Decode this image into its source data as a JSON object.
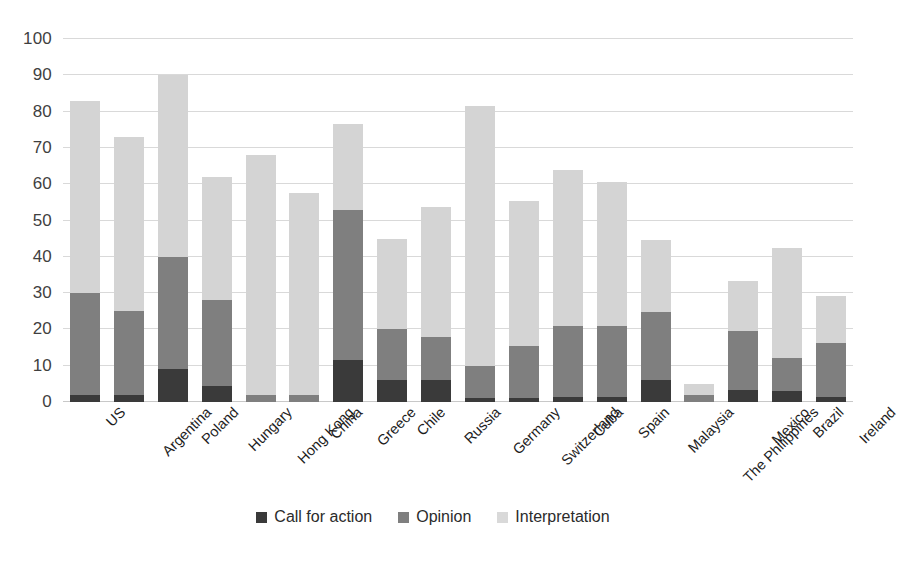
{
  "chart_data": {
    "type": "bar",
    "subtype": "stacked-bar",
    "title": "",
    "xlabel": "",
    "ylabel": "",
    "ylim": [
      0,
      100
    ],
    "yticks": [
      0,
      10,
      20,
      30,
      40,
      50,
      60,
      70,
      80,
      90,
      100
    ],
    "grid": true,
    "legend_position": "bottom",
    "categories": [
      "US",
      "Argentina",
      "Poland",
      "Hungary",
      "Hong Kong",
      "China",
      "Greece",
      "Chile",
      "Russia",
      "Germany",
      "Switzerland",
      "Cuba",
      "Spain",
      "Malaysia",
      "The Philippines",
      "Mexico",
      "Brazil",
      "Ireland"
    ],
    "series": [
      {
        "name": "Call for action",
        "color": "#3a3a3a",
        "values": [
          2,
          2,
          9,
          4.5,
          0,
          0,
          11.5,
          6,
          6,
          1,
          1,
          1.5,
          1.5,
          6,
          0,
          3.3,
          3,
          1.5
        ]
      },
      {
        "name": "Opinion",
        "color": "#7f7f7f",
        "values": [
          28,
          23,
          31,
          23.5,
          2,
          2,
          41.5,
          14,
          12,
          9,
          14.5,
          19.5,
          19.5,
          18.7,
          2,
          16.4,
          9,
          14.7
        ]
      },
      {
        "name": "Interpretation",
        "color": "#d4d4d4",
        "values": [
          53,
          48,
          50,
          34,
          66,
          55.5,
          23.5,
          24.8,
          35.6,
          71.5,
          40,
          43,
          39.7,
          20,
          3,
          13.7,
          30.3,
          13
        ]
      }
    ],
    "totals": [
      83,
      73,
      90,
      62,
      68,
      57.5,
      76.5,
      44.8,
      53.6,
      81.5,
      55.5,
      64,
      60.7,
      44.7,
      5,
      33.4,
      42.3,
      29.2
    ]
  },
  "legend": {
    "items": [
      {
        "label": "Call for action",
        "swatch": "call"
      },
      {
        "label": "Opinion",
        "swatch": "opinion"
      },
      {
        "label": "Interpretation",
        "swatch": "interpretation"
      }
    ]
  }
}
